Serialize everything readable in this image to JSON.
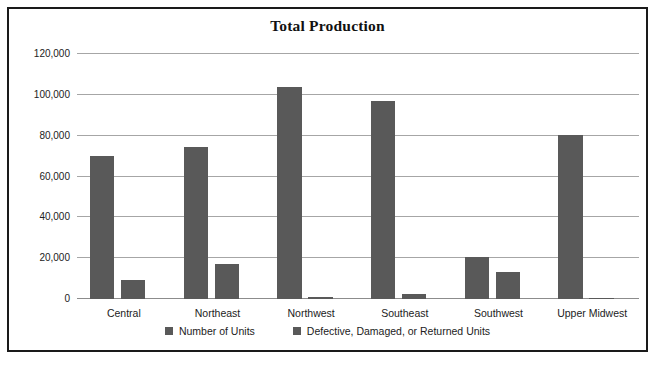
{
  "chart_data": {
    "type": "bar",
    "title": "Total Production",
    "xlabel": "",
    "ylabel": "",
    "ylim": [
      0,
      120000
    ],
    "ytick_values": [
      0,
      20000,
      40000,
      60000,
      80000,
      100000,
      120000
    ],
    "ytick_labels": [
      "0",
      "20,000",
      "40,000",
      "60,000",
      "80,000",
      "100,000",
      "120,000"
    ],
    "grid": true,
    "legend_position": "bottom",
    "bar_color": "#595959",
    "categories": [
      "Central",
      "Northeast",
      "Northwest",
      "Southeast",
      "Southwest",
      "Upper Midwest"
    ],
    "series": [
      {
        "name": "Number of Units",
        "color": "#595959",
        "values": [
          70000,
          74500,
          104000,
          96800,
          20700,
          80300
        ]
      },
      {
        "name": "Defective, Damaged, or Returned Units",
        "color": "#595959",
        "values": [
          9500,
          17200,
          1200,
          2500,
          13300,
          600
        ]
      }
    ]
  },
  "legend": {
    "items": [
      {
        "label": "Number of Units"
      },
      {
        "label": "Defective, Damaged, or Returned Units"
      }
    ]
  }
}
